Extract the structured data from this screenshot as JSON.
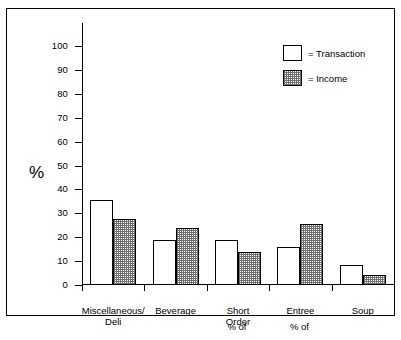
{
  "chart_data": {
    "type": "bar",
    "title": "",
    "subtitle": "",
    "xlabel": "",
    "ylabel": "%",
    "ylim": [
      0,
      100
    ],
    "ytick_step": 10,
    "yticks": [
      "100",
      "90",
      "80",
      "70",
      "60",
      "50",
      "40",
      "30",
      "20",
      "10",
      "0"
    ],
    "grid": false,
    "legend_position": "top-right",
    "categories": [
      "Miscellaneous/\nDeli",
      "Beverage",
      "Short\nOrder",
      "Entree",
      "Soup"
    ],
    "category_lines": [
      [
        "Miscellaneous/",
        "Deli"
      ],
      [
        "Beverage",
        ""
      ],
      [
        "Short",
        "Order"
      ],
      [
        "Entree",
        ""
      ],
      [
        "Soup",
        ""
      ]
    ],
    "series": [
      {
        "name": "Transaction",
        "values": [
          35.5,
          19,
          19,
          16,
          8.5
        ]
      },
      {
        "name": "Income",
        "values": [
          27.5,
          24,
          14,
          25.5,
          4
        ]
      }
    ],
    "annotations": [
      {
        "text": "% of",
        "under": "Short Order"
      },
      {
        "text": "% of",
        "under": "Entree"
      }
    ]
  },
  "legend": {
    "items": [
      {
        "swatch": "transaction",
        "label": "= Transaction"
      },
      {
        "swatch": "income",
        "label": "= Income"
      }
    ]
  },
  "colors": {
    "ink": "#000000",
    "paper": "#ffffff",
    "hatch": "#6e6e6e"
  }
}
